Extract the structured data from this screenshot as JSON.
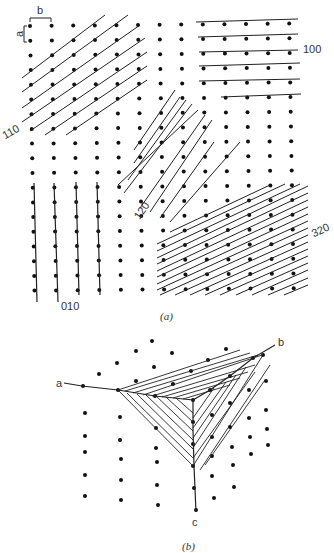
{
  "figure_a": {
    "caption": "(a)",
    "unit_cell_labels": {
      "a": "a",
      "b": "b"
    },
    "plane_labels": {
      "p110": "110",
      "p100": "100",
      "p120": "120",
      "p320": "320",
      "p010": "010"
    }
  },
  "figure_b": {
    "caption": "(b)",
    "axis_labels": {
      "a": "a",
      "b": "b",
      "c": "c"
    }
  },
  "colors": {
    "ink": "#1a1a1a",
    "background": "#ffffff"
  }
}
